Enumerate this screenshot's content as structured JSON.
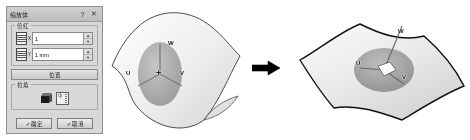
{
  "dialog": {
    "title": "缩放体",
    "help_label": "?",
    "close_label": "✕",
    "group_scale": {
      "legend": "倍红",
      "fields": [
        {
          "sub": "X",
          "value": "1",
          "icon": "layers-icon",
          "up": "▲",
          "down": "▼"
        },
        {
          "sub": "Y",
          "value": "1 mm",
          "icon": "layers-icon",
          "up": "▲",
          "down": "▼"
        }
      ],
      "position_button": "位置"
    },
    "group_corner": {
      "legend": "拉角",
      "cube_icon": "cube-icon",
      "grid_icon": "grid-icon",
      "grid_glyph": "中"
    },
    "buttons": {
      "ok": "确定",
      "cancel": "取消",
      "ok_mark": "✔",
      "cancel_mark": "✔"
    }
  },
  "diagram": {
    "arrow_icon": "right-arrow-icon",
    "before": {
      "name": "wavy-surface-before",
      "labels": [
        {
          "text": "W",
          "x": 62,
          "y": 41
        },
        {
          "text": "U",
          "x": 22,
          "y": 72
        },
        {
          "text": "V",
          "x": 72,
          "y": 72
        },
        {
          "text": "+",
          "x": 52,
          "y": 70
        }
      ]
    },
    "after": {
      "name": "wavy-surface-after",
      "labels": [
        {
          "text": "W",
          "x": 102,
          "y": 26
        },
        {
          "text": "U",
          "x": 62,
          "y": 62
        },
        {
          "text": "V",
          "x": 106,
          "y": 73
        }
      ]
    }
  },
  "colors": {
    "dialog_face": "#d8d8d8",
    "dialog_border": "#8f8f8f",
    "surface_fill": "#ededed",
    "surface_stroke": "#1a1a1a",
    "triad_fill": "#9a9a9a",
    "arrow": "#000000"
  }
}
